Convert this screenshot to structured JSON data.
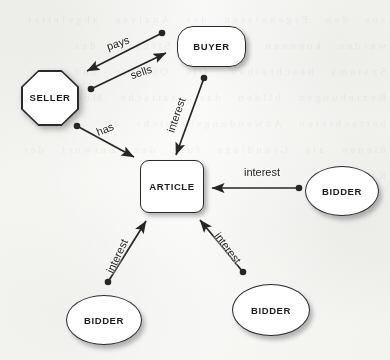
{
  "diagram": {
    "background_color": "#fbfbfa",
    "stroke_color": "#2a2a2a",
    "text_color": "#1d1d1d",
    "nodes": [
      {
        "id": "seller",
        "label": "SELLER",
        "shape": "octagon",
        "x": 21,
        "y": 70,
        "w": 58,
        "h": 56
      },
      {
        "id": "buyer",
        "label": "BUYER",
        "shape": "rounded-rect",
        "x": 177,
        "y": 26,
        "w": 69,
        "h": 41
      },
      {
        "id": "article",
        "label": "ARTICLE",
        "shape": "rounded-square",
        "x": 140,
        "y": 160,
        "w": 64,
        "h": 53
      },
      {
        "id": "bidder1",
        "label": "BIDDER",
        "shape": "ellipse",
        "x": 305,
        "y": 166,
        "w": 74,
        "h": 50
      },
      {
        "id": "bidder2",
        "label": "BIDDER",
        "shape": "ellipse",
        "x": 66,
        "y": 295,
        "w": 76,
        "h": 50
      },
      {
        "id": "bidder3",
        "label": "BIDDER",
        "shape": "ellipse",
        "x": 232,
        "y": 284,
        "w": 78,
        "h": 52
      }
    ],
    "edges": [
      {
        "id": "pays",
        "label": "pays",
        "from": "buyer",
        "to": "seller",
        "label_x": 118,
        "label_y": 43,
        "label_rotation": -19
      },
      {
        "id": "sells",
        "label": "sells",
        "from": "seller",
        "to": "buyer",
        "label_x": 141,
        "label_y": 72,
        "label_rotation": -19
      },
      {
        "id": "has",
        "label": "has",
        "from": "seller",
        "to": "article",
        "label_x": 105,
        "label_y": 129,
        "label_rotation": -22
      },
      {
        "id": "interest1",
        "label": "interest",
        "from": "buyer",
        "to": "article",
        "label_x": 176,
        "label_y": 115,
        "label_rotation": -71
      },
      {
        "id": "interest2",
        "label": "interest",
        "from": "bidder1",
        "to": "article",
        "label_x": 262,
        "label_y": 172,
        "label_rotation": 0
      },
      {
        "id": "interest3",
        "label": "interest",
        "from": "bidder2",
        "to": "article",
        "label_x": 117,
        "label_y": 256,
        "label_rotation": -65
      },
      {
        "id": "interest4",
        "label": "interest",
        "from": "bidder3",
        "to": "article",
        "label_x": 228,
        "label_y": 248,
        "label_rotation": 53
      }
    ]
  },
  "ghost_text": "aus den Ergebnissen der Analyse abgeleitet werden koennen und die Struktur des Systems beschreiben. Die Objekte und ihre Beziehungen bilden das statische Modell des betrachteten Anwendungsbereichs ab und dienen als Grundlage fuer den Entwurf der Klassen."
}
